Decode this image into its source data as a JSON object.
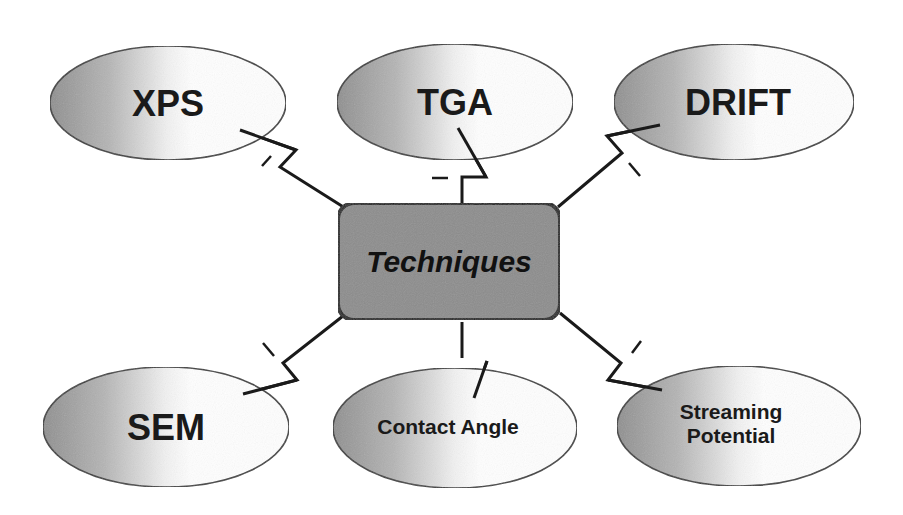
{
  "diagram": {
    "center": {
      "label": "Techniques",
      "fill": "#8c8c8c",
      "border": "#1a1a1a"
    },
    "nodes": [
      {
        "id": "xps",
        "label": "XPS"
      },
      {
        "id": "tga",
        "label": "TGA"
      },
      {
        "id": "drift",
        "label": "DRIFT"
      },
      {
        "id": "sem",
        "label": "SEM"
      },
      {
        "id": "contact-angle",
        "label": "Contact Angle"
      },
      {
        "id": "streaming-potential",
        "label_line1": "Streaming",
        "label_line2": "Potential"
      }
    ],
    "colors": {
      "ellipse_dark": "#9a9a9a",
      "ellipse_light": "#ffffff",
      "line": "#1a1a1a"
    }
  }
}
